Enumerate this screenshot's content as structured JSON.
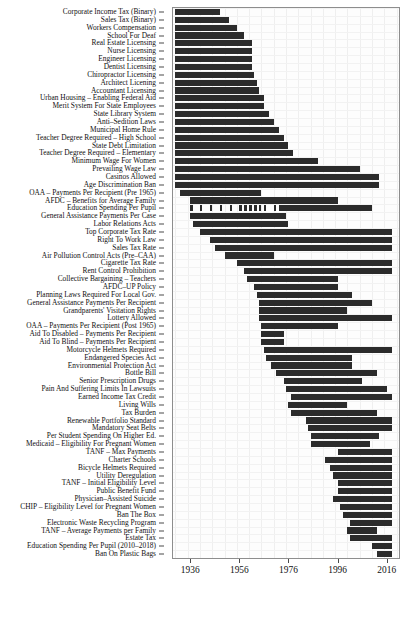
{
  "chart_data": {
    "type": "bar",
    "orientation": "horizontal",
    "title": "",
    "subtitle": "",
    "xlabel": "",
    "ylabel": "",
    "xlim": [
      1929,
      2021
    ],
    "grid": true,
    "legend": null,
    "bar_color": "#2b2b2b",
    "xticks": [
      1936,
      1956,
      1976,
      1996,
      2016
    ],
    "xticklabels": [
      "1936",
      "1956",
      "1976",
      "1996",
      "2016"
    ],
    "categories": [
      "Corporate Income Tax (Binary)",
      "Sales Tax (Binary)",
      "Workers Compensation",
      "School For Deaf",
      "Real Estate Licensing",
      "Nurse Licensing",
      "Engineer Licensing",
      "Dentist Licensing",
      "Chiropractor Licensing",
      "Architect Licening",
      "Accountant Licensing",
      "Urban Housing – Enabling Federal Aid",
      "Merit System For State Employees",
      "State Library System",
      "Anti–Sedition Laws",
      "Municipal Home Rule",
      "Teacher Degree Required – High School",
      "State Debt Limitation",
      "Teacher Degree Required – Elementary",
      "Minimum Wage For Women",
      "Prevailing Wage Law",
      "Casinos Allowed",
      "Age Discrimination Ban",
      "OAA – Payments Per Recipient (Pre 1965)",
      "AFDC – Benefits for Average Family",
      "Education Spending Per Pupil",
      "General Assistance Payments Per Case",
      "Labor Relations Acts",
      "Top Corporate Tax Rate",
      "Right To Work Law",
      "Sales Tax Rate",
      "Air Pollution Control Acts (Pre–CAA)",
      "Cigarette Tax Rate",
      "Rent Control Prohibition",
      "Collective Bargaining – Teachers",
      "AFDC–UP Policy",
      "Planning Laws Required For Local Gov.",
      "General Assistance Payments Per Recipient",
      "Grandparents' Visitation Rights",
      "Lottery Allowed",
      "OAA – Payments Per Recipient (Post 1965)",
      "Aid To Disabled – Payments Per Recipient",
      "Aid To Blind – Payments Per Recipient",
      "Motorcycle Helmets Required",
      "Endangered Species Act",
      "Environmental Protection Act",
      "Bottle Bill",
      "Senior Prescription Drugs",
      "Pain And Suffering Limits In Lawsuits",
      "Earned Income Tax Credit",
      "Living Wills",
      "Tax Burden",
      "Renewable Portfolio Standard",
      "Mandatory Seat Belts",
      "Per Student Spending On Higher Ed.",
      "Medicaid – Eligibility For Pregnant Women",
      "TANF – Max Payments",
      "Charter Schools",
      "Bicycle Helmets Required",
      "Utility Deregulation",
      "TANF – Initial Eligibility Level",
      "Public Benefit Fund",
      "Physician–Assisted Suicide",
      "CHIP – Eligibility Level for Pregnant Women",
      "Ban The Box",
      "Electronic Waste Recycling Program",
      "TANF – Average Payments per Family",
      "Estate Tax",
      "Education Spending Per Pupil (2010–2018)",
      "Ban On Plastic Bags"
    ],
    "spans": [
      {
        "category": "Corporate Income Tax (Binary)",
        "segments": [
          [
            1930,
            1948
          ]
        ]
      },
      {
        "category": "Sales Tax (Binary)",
        "segments": [
          [
            1930,
            1952
          ]
        ]
      },
      {
        "category": "Workers Compensation",
        "segments": [
          [
            1930,
            1955
          ]
        ]
      },
      {
        "category": "School For Deaf",
        "segments": [
          [
            1930,
            1958
          ]
        ]
      },
      {
        "category": "Real Estate Licensing",
        "segments": [
          [
            1930,
            1961
          ]
        ]
      },
      {
        "category": "Nurse Licensing",
        "segments": [
          [
            1930,
            1961
          ]
        ]
      },
      {
        "category": "Engineer Licensing",
        "segments": [
          [
            1930,
            1961
          ]
        ]
      },
      {
        "category": "Dentist Licensing",
        "segments": [
          [
            1930,
            1961
          ]
        ]
      },
      {
        "category": "Chiropractor Licensing",
        "segments": [
          [
            1930,
            1962
          ]
        ]
      },
      {
        "category": "Architect Licening",
        "segments": [
          [
            1930,
            1963
          ]
        ]
      },
      {
        "category": "Accountant Licensing",
        "segments": [
          [
            1930,
            1964
          ]
        ]
      },
      {
        "category": "Urban Housing – Enabling Federal Aid",
        "segments": [
          [
            1930,
            1966
          ]
        ]
      },
      {
        "category": "Merit System For State Employees",
        "segments": [
          [
            1930,
            1966
          ]
        ]
      },
      {
        "category": "State Library System",
        "segments": [
          [
            1930,
            1968
          ]
        ]
      },
      {
        "category": "Anti–Sedition Laws",
        "segments": [
          [
            1930,
            1970
          ]
        ]
      },
      {
        "category": "Municipal Home Rule",
        "segments": [
          [
            1930,
            1972
          ]
        ]
      },
      {
        "category": "Teacher Degree Required – High School",
        "segments": [
          [
            1930,
            1974
          ]
        ]
      },
      {
        "category": "State Debt Limitation",
        "segments": [
          [
            1930,
            1976
          ]
        ]
      },
      {
        "category": "Teacher Degree Required – Elementary",
        "segments": [
          [
            1930,
            1978
          ]
        ]
      },
      {
        "category": "Minimum Wage For Women",
        "segments": [
          [
            1930,
            1988
          ]
        ]
      },
      {
        "category": "Prevailing Wage Law",
        "segments": [
          [
            1930,
            2005
          ]
        ]
      },
      {
        "category": "Casinos Allowed",
        "segments": [
          [
            1930,
            2013
          ]
        ]
      },
      {
        "category": "Age Discrimination Ban",
        "segments": [
          [
            1930,
            2013
          ]
        ]
      },
      {
        "category": "OAA – Payments Per Recipient (Pre 1965)",
        "segments": [
          [
            1932,
            1965
          ]
        ]
      },
      {
        "category": "AFDC – Benefits for Average Family",
        "segments": [
          [
            1936,
            1996
          ]
        ]
      },
      {
        "category": "Education Spending Per Pupil",
        "segments": [
          [
            1936,
            1937
          ],
          [
            1940,
            1941
          ],
          [
            1944,
            1945
          ],
          [
            1948,
            1949
          ],
          [
            1952,
            1953
          ],
          [
            1956,
            1957
          ],
          [
            1958,
            1959
          ],
          [
            1960,
            1961
          ],
          [
            1962,
            1963
          ],
          [
            1964,
            1965
          ],
          [
            1966,
            1967
          ],
          [
            1970,
            1971
          ],
          [
            1972,
            2010
          ]
        ]
      },
      {
        "category": "General Assistance Payments Per Case",
        "segments": [
          [
            1936,
            1975
          ]
        ]
      },
      {
        "category": "Labor Relations Acts",
        "segments": [
          [
            1937,
            1976
          ]
        ]
      },
      {
        "category": "Top Corporate Tax Rate",
        "segments": [
          [
            1940,
            2018
          ]
        ]
      },
      {
        "category": "Top Corporate Tax Rate2",
        "segments": []
      },
      {
        "category": "Right To Work Law",
        "segments": [
          [
            1944,
            2018
          ]
        ]
      },
      {
        "category": "Sales Tax Rate",
        "segments": [
          [
            1946,
            2018
          ]
        ]
      },
      {
        "category": "Air Pollution Control Acts (Pre–CAA)",
        "segments": [
          [
            1950,
            1970
          ]
        ]
      },
      {
        "category": "Cigarette Tax Rate",
        "segments": [
          [
            1955,
            2018
          ]
        ]
      },
      {
        "category": "Rent Control Prohibition",
        "segments": [
          [
            1958,
            2018
          ]
        ]
      },
      {
        "category": "Collective Bargaining – Teachers",
        "segments": [
          [
            1959,
            1996
          ]
        ]
      },
      {
        "category": "AFDC–UP Policy",
        "segments": [
          [
            1962,
            1996
          ]
        ]
      },
      {
        "category": "Planning Laws Required For Local Gov.",
        "segments": [
          [
            1963,
            2002
          ]
        ]
      },
      {
        "category": "General Assistance Payments Per Recipient",
        "segments": [
          [
            1964,
            2010
          ]
        ]
      },
      {
        "category": "Grandparents' Visitation Rights",
        "segments": [
          [
            1964,
            2000
          ]
        ]
      },
      {
        "category": "Lottery Allowed",
        "segments": [
          [
            1964,
            2018
          ]
        ]
      },
      {
        "category": "OAA – Payments Per Recipient (Post 1965)",
        "segments": [
          [
            1965,
            1996
          ]
        ]
      },
      {
        "category": "Aid To Disabled – Payments Per Recipient",
        "segments": [
          [
            1965,
            1974
          ]
        ]
      },
      {
        "category": "Aid To Blind – Payments Per Recipient",
        "segments": [
          [
            1965,
            1974
          ]
        ]
      },
      {
        "category": "Motorcycle Helmets Required",
        "segments": [
          [
            1966,
            2018
          ]
        ]
      },
      {
        "category": "Endangered Species Act",
        "segments": [
          [
            1967,
            2002
          ]
        ]
      },
      {
        "category": "Environmental Protection Act",
        "segments": [
          [
            1969,
            2002
          ]
        ]
      },
      {
        "category": "Bottle Bill",
        "segments": [
          [
            1971,
            2012
          ]
        ]
      },
      {
        "category": "Senior Prescription Drugs",
        "segments": [
          [
            1974,
            2006
          ]
        ]
      },
      {
        "category": "Pain And Suffering Limits In Lawsuits",
        "segments": [
          [
            1975,
            2016
          ]
        ]
      },
      {
        "category": "Earned Income Tax Credit",
        "segments": [
          [
            1977,
            2018
          ]
        ]
      },
      {
        "category": "Living Wills",
        "segments": [
          [
            1976,
            2000
          ]
        ]
      },
      {
        "category": "Tax Burden",
        "segments": [
          [
            1977,
            2012
          ]
        ]
      },
      {
        "category": "Renewable Portfolio Standard",
        "segments": [
          [
            1983,
            2018
          ]
        ]
      },
      {
        "category": "Mandatory Seat Belts",
        "segments": [
          [
            1984,
            2018
          ]
        ]
      },
      {
        "category": "Per Student Spending On Higher Ed.",
        "segments": [
          [
            1985,
            2013
          ]
        ]
      },
      {
        "category": "Medicaid – Eligibility For Pregnant Women",
        "segments": [
          [
            1985,
            2009
          ]
        ]
      },
      {
        "category": "TANF – Max Payments",
        "segments": [
          [
            1996,
            2018
          ]
        ]
      },
      {
        "category": "Charter Schools",
        "segments": [
          [
            1991,
            2018
          ]
        ]
      },
      {
        "category": "Bicycle Helmets Required",
        "segments": [
          [
            1993,
            2018
          ]
        ]
      },
      {
        "category": "Utility Deregulation",
        "segments": [
          [
            1994,
            2018
          ]
        ]
      },
      {
        "category": "TANF – Initial Eligibility Level",
        "segments": [
          [
            1996,
            2018
          ]
        ]
      },
      {
        "category": "Public Benefit Fund",
        "segments": [
          [
            1996,
            2018
          ]
        ]
      },
      {
        "category": "Physician–Assisted Suicide",
        "segments": [
          [
            1994,
            2018
          ]
        ]
      },
      {
        "category": "CHIP – Eligibility Level for Pregnant Women",
        "segments": [
          [
            1997,
            2018
          ]
        ]
      },
      {
        "category": "Ban The Box",
        "segments": [
          [
            1998,
            2018
          ]
        ]
      },
      {
        "category": "Electronic Waste Recycling Program",
        "segments": [
          [
            2001,
            2018
          ]
        ]
      },
      {
        "category": "TANF – Average Payments per Family",
        "segments": [
          [
            2000,
            2012
          ]
        ]
      },
      {
        "category": "Estate Tax",
        "segments": [
          [
            2001,
            2018
          ]
        ]
      },
      {
        "category": "Education Spending Per Pupil (2010–2018)",
        "segments": [
          [
            2010,
            2018
          ]
        ]
      },
      {
        "category": "Ban On Plastic Bags",
        "segments": [
          [
            2012,
            2018
          ]
        ]
      }
    ]
  }
}
